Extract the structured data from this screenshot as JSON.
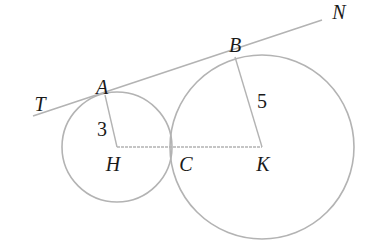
{
  "diagram": {
    "type": "geometry",
    "colors": {
      "stroke": "#b3b3b3",
      "text": "#1a1a1a",
      "background": "#ffffff"
    },
    "circles": [
      {
        "id": "small",
        "center": "H",
        "cx": 117,
        "cy": 147,
        "r": 55
      },
      {
        "id": "large",
        "center": "K",
        "cx": 262,
        "cy": 147,
        "r": 92
      }
    ],
    "segments": [
      {
        "id": "tangent-TN",
        "from": "T",
        "to": "N",
        "x1": 33,
        "y1": 116,
        "x2": 322,
        "y2": 20
      },
      {
        "id": "radius-HA",
        "from": "H",
        "to": "A",
        "x1": 117,
        "y1": 147,
        "x2": 105,
        "y2": 95
      },
      {
        "id": "radius-KB",
        "from": "K",
        "to": "B",
        "x1": 262,
        "y1": 147,
        "x2": 235,
        "y2": 57
      },
      {
        "id": "segment-HK",
        "from": "H",
        "to": "K",
        "x1": 117,
        "y1": 147,
        "x2": 262,
        "y2": 147
      }
    ],
    "labels": {
      "T": {
        "text": "T",
        "x": 40,
        "y": 104
      },
      "A": {
        "text": "A",
        "x": 102,
        "y": 87
      },
      "B": {
        "text": "B",
        "x": 235,
        "y": 45
      },
      "N": {
        "text": "N",
        "x": 339,
        "y": 12
      },
      "H": {
        "text": "H",
        "x": 113,
        "y": 164
      },
      "C": {
        "text": "C",
        "x": 186,
        "y": 164
      },
      "K": {
        "text": "K",
        "x": 263,
        "y": 164
      },
      "r_small": {
        "text": "3",
        "x": 102,
        "y": 129
      },
      "r_large": {
        "text": "5",
        "x": 262,
        "y": 101
      }
    }
  }
}
